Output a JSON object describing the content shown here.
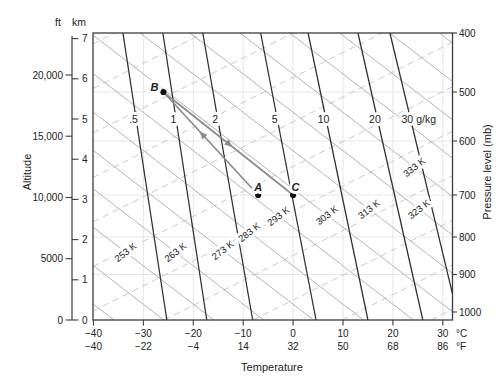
{
  "figure": {
    "background": "#ffffff"
  },
  "colors": {
    "mixing_ratio_line": "#2e2e2e",
    "dry_adiabat": "#b4b4b4",
    "moist_adiabat": "#c9c9c9",
    "grid": "#e3e3e3",
    "axis": "#3c3c3c",
    "arrow": "#8c8c8c",
    "point": "#111111",
    "adiabat_label": "#3d3d3d"
  },
  "chart_data": {
    "type": "line",
    "kind": "thermodynamic-adiabatic-chart",
    "grid": "light gray at every 10 C vertical and every 100 mb horizontal",
    "x_axis": {
      "title": "Temperature",
      "unit_c": "°C",
      "unit_f": "°F",
      "values_c": [
        -40,
        -30,
        -20,
        -10,
        0,
        10,
        20,
        30
      ],
      "ticks_c": [
        "−40",
        "−30",
        "−20",
        "−10",
        "0",
        "10",
        "20",
        "30"
      ],
      "labels_f": [
        "−40",
        "−22",
        "−4",
        "14",
        "32",
        "50",
        "68",
        "86"
      ],
      "range_c": [
        -40,
        32
      ]
    },
    "y_axis_left": {
      "title": "Altitude",
      "unit_ft": "ft",
      "unit_km": "km",
      "values_km": [
        0,
        1,
        2,
        3,
        4,
        5,
        6,
        7
      ],
      "ticks_km": [
        "0",
        "1",
        "2",
        "3",
        "4",
        "5",
        "6",
        "7"
      ],
      "values_ft": [
        0,
        5000,
        10000,
        15000,
        20000
      ],
      "labels_ft": [
        "0",
        "5000",
        "10,000",
        "15,000",
        "20,000"
      ],
      "range_km": [
        0,
        7.1
      ]
    },
    "y_axis_right": {
      "title": "Pressure level (mb)",
      "ticks_mb": [
        "400",
        "500",
        "600",
        "700",
        "800",
        "900",
        "1000"
      ],
      "values_mb": [
        400,
        500,
        600,
        700,
        800,
        900,
        1000
      ]
    },
    "mixing_ratio_lines": {
      "unit": "g/kg",
      "style": "solid dark, steep, labeled in a gap near 5.0 km",
      "lines": [
        {
          "label": ".5",
          "value": 0.5,
          "t_top_c": -34.1,
          "t_bottom_c": -25.3
        },
        {
          "label": "1",
          "value": 1,
          "t_top_c": -26.1,
          "t_bottom_c": -17.3
        },
        {
          "label": "2",
          "value": 2,
          "t_top_c": -18.1,
          "t_bottom_c": -8.1
        },
        {
          "label": "5",
          "value": 5,
          "t_top_c": -6.5,
          "t_bottom_c": 4.6
        },
        {
          "label": "10",
          "value": 10,
          "t_top_c": 3.0,
          "t_bottom_c": 15.0
        },
        {
          "label": "20",
          "value": 20,
          "t_top_c": 13.0,
          "t_bottom_c": 26.0
        },
        {
          "label": "30 g/kg",
          "value": 30,
          "t_top_c": 19.4,
          "t_bottom_c": 33.2
        }
      ]
    },
    "dry_adiabats": {
      "unit": "K",
      "style": "solid light gray, rising left to right labels rotated along line",
      "values_k": [
        233,
        243,
        253,
        263,
        273,
        283,
        293,
        303,
        313,
        323,
        333,
        343,
        353,
        363,
        373
      ],
      "labeled": [
        {
          "label": "253 K",
          "value": 253
        },
        {
          "label": "263 K",
          "value": 263
        },
        {
          "label": "273 K",
          "value": 273
        },
        {
          "label": "283 K",
          "value": 283
        },
        {
          "label": "293 K",
          "value": 293
        },
        {
          "label": "303 K",
          "value": 303
        },
        {
          "label": "313 K",
          "value": 313
        },
        {
          "label": "323 K",
          "value": 323
        },
        {
          "label": "333 K",
          "value": 333
        }
      ]
    },
    "moist_adiabats": {
      "style": "dashed light gray, unlabeled, shallower slope than dry adiabats",
      "labeled": false,
      "count": 11
    },
    "points": [
      {
        "id": "A",
        "temp_c": -7,
        "pressure_mb": 700
      },
      {
        "id": "B",
        "temp_c": -26,
        "pressure_mb": 500
      },
      {
        "id": "C",
        "temp_c": 0,
        "pressure_mb": 700
      }
    ],
    "arrows": [
      {
        "from": "A",
        "to": "B",
        "meaning": "parcel rises from A to B"
      },
      {
        "from": "B",
        "to": "C",
        "meaning": "parcel sinks from B to C"
      }
    ]
  }
}
